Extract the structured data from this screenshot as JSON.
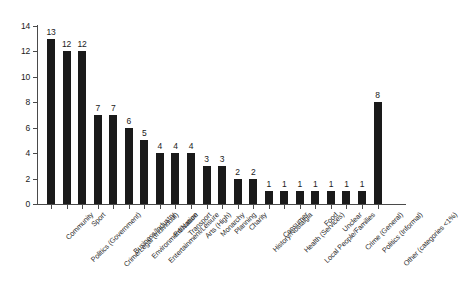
{
  "chart_data": {
    "type": "bar",
    "title": "",
    "subtitle": "",
    "xlabel": "",
    "ylabel": "",
    "ylim": [
      0,
      14
    ],
    "yticks": [
      0,
      2,
      4,
      6,
      8,
      10,
      12,
      14
    ],
    "grid": false,
    "legend": false,
    "bar_color": "#1a1a1a",
    "background_color": "#ffffff",
    "axis_color": "#4a4a4a",
    "value_labels_shown": true,
    "categories": [
      "Community",
      "Politics (Government)",
      "Sport",
      "Crime/Legal (Individual)",
      "Business/Industry",
      "Environment/Nature",
      "Entertainment/Leisure",
      "Education",
      "Transport",
      "Arts (High)",
      "Monarchy",
      "Planning",
      "Charity",
      "History/Nostalgia",
      "Consumer",
      "Health (Services)",
      "Local People/Families",
      "Food",
      "Unclear",
      "Crime (General)",
      "Politics (Informal)",
      "Other (categories <1%)"
    ],
    "values": [
      13,
      12,
      12,
      7,
      7,
      6,
      5,
      4,
      4,
      4,
      3,
      3,
      2,
      2,
      1,
      1,
      1,
      1,
      1,
      1,
      1,
      8
    ]
  }
}
